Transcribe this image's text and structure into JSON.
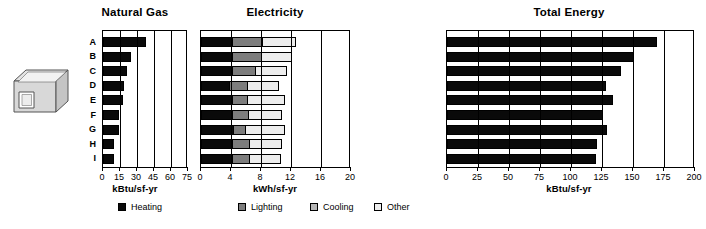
{
  "icon": {
    "name": "building-box-icon"
  },
  "panels": [
    {
      "id": "natural-gas",
      "title": "Natural Gas",
      "axis_title": "kBtu/sf-yr",
      "ticks": [
        "0",
        "15",
        "30",
        "45",
        "60",
        "75"
      ],
      "xmax": 75
    },
    {
      "id": "electricity",
      "title": "Electricity",
      "axis_title": "kWh/sf-yr",
      "ticks": [
        "0",
        "4",
        "8",
        "12",
        "16",
        "20"
      ],
      "xmax": 20
    },
    {
      "id": "total-energy",
      "title": "Total Energy",
      "axis_title": "kBtu/sf-yr",
      "ticks": [
        "0",
        "25",
        "50",
        "75",
        "100",
        "125",
        "150",
        "175",
        "200"
      ],
      "xmax": 200
    }
  ],
  "categories": [
    "A",
    "B",
    "C",
    "D",
    "E",
    "F",
    "G",
    "H",
    "I"
  ],
  "legend": [
    {
      "label": "Heating",
      "color": "#0a0a0a"
    },
    {
      "label": "Lighting",
      "color": "#7d7d7d"
    },
    {
      "label": "Cooling",
      "color": "#b5b5b5"
    },
    {
      "label": "Other",
      "color": "#ededed"
    }
  ],
  "chart_data": [
    {
      "type": "bar",
      "title": "Natural Gas",
      "xlabel": "kBtu/sf-yr",
      "ylabel": "",
      "orientation": "horizontal",
      "xlim": [
        0,
        75
      ],
      "xticks": [
        0,
        15,
        30,
        45,
        60,
        75
      ],
      "grid": true,
      "legend": "bottom",
      "categories": [
        "A",
        "B",
        "C",
        "D",
        "E",
        "F",
        "G",
        "H",
        "I"
      ],
      "series": [
        {
          "name": "Heating",
          "color": "#0a0a0a",
          "values": [
            37.5,
            24.5,
            21.0,
            18.5,
            17.5,
            14.0,
            14.0,
            10.0,
            9.5
          ]
        }
      ]
    },
    {
      "type": "bar",
      "title": "Electricity",
      "xlabel": "kWh/sf-yr",
      "ylabel": "",
      "orientation": "horizontal",
      "stacked": true,
      "xlim": [
        0,
        20
      ],
      "xticks": [
        0,
        4,
        8,
        12,
        16,
        20
      ],
      "grid": true,
      "legend": "bottom",
      "categories": [
        "A",
        "B",
        "C",
        "D",
        "E",
        "F",
        "G",
        "H",
        "I"
      ],
      "series": [
        {
          "name": "Heating",
          "color": "#0a0a0a",
          "values": [
            4.3,
            4.3,
            4.3,
            3.9,
            4.2,
            4.2,
            4.4,
            4.2,
            4.2
          ]
        },
        {
          "name": "Lighting",
          "color": "#7d7d7d",
          "values": [
            4.1,
            4.0,
            3.1,
            2.5,
            2.2,
            2.3,
            1.7,
            2.5,
            2.4
          ]
        },
        {
          "name": "Cooling",
          "color": "#b5b5b5",
          "values": [
            0.0,
            0.0,
            0.0,
            0.0,
            0.0,
            0.0,
            0.0,
            0.0,
            0.0
          ]
        },
        {
          "name": "Other",
          "color": "#ededed",
          "values": [
            4.5,
            4.1,
            4.3,
            4.2,
            5.1,
            4.5,
            5.4,
            4.4,
            4.3
          ]
        }
      ],
      "totals": [
        12.9,
        12.4,
        11.7,
        10.6,
        11.5,
        11.0,
        11.5,
        11.1,
        10.9
      ]
    },
    {
      "type": "bar",
      "title": "Total Energy",
      "xlabel": "kBtu/sf-yr",
      "ylabel": "",
      "orientation": "horizontal",
      "xlim": [
        0,
        200
      ],
      "xticks": [
        0,
        25,
        50,
        75,
        100,
        125,
        150,
        175,
        200
      ],
      "grid": true,
      "legend": "bottom",
      "categories": [
        "A",
        "B",
        "C",
        "D",
        "E",
        "F",
        "G",
        "H",
        "I"
      ],
      "series": [
        {
          "name": "Total",
          "color": "#0a0a0a",
          "values": [
            169,
            151,
            140,
            128,
            134,
            126,
            129,
            121,
            120
          ]
        }
      ]
    }
  ]
}
